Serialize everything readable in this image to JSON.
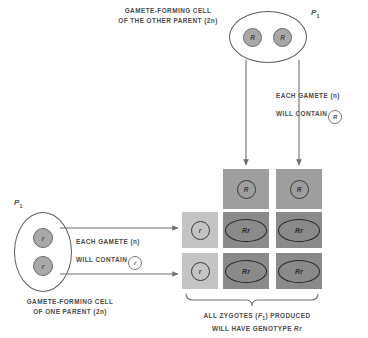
{
  "diagram": {
    "title_top": "GAMETE-FORMING CELL OF THE OTHER PARENT (2n)",
    "top_cell": {
      "label_line1": "GAMETE-FORMING CELL",
      "label_line2": "OF THE OTHER PARENT (2n)",
      "generation_label": "P",
      "generation_sub": "1",
      "alleles": [
        "R",
        "R"
      ]
    },
    "left_cell": {
      "label_line1": "GAMETE-FORMING CELL",
      "label_line2": "OF ONE PARENT (2n)",
      "generation_label": "P",
      "generation_sub": "1",
      "alleles": [
        "r",
        "r"
      ]
    },
    "right_note": {
      "line1": "EACH GAMETE (n)",
      "line2": "WILL CONTAIN",
      "token": "R"
    },
    "left_note": {
      "line1": "EACH GAMETE (n)",
      "line2": "WILL CONTAIN",
      "token": "r"
    },
    "bottom_note": {
      "line1": "ALL ZYGOTES (F1) PRODUCED",
      "line2": "WILL HAVE GENOTYPE Rr",
      "f_letter": "F",
      "f_sub": "1",
      "genotype": "Rr"
    },
    "punnett": {
      "column_gametes": [
        "R",
        "R"
      ],
      "row_gametes": [
        "r",
        "r"
      ],
      "offspring": [
        [
          "Rr",
          "Rr"
        ],
        [
          "Rr",
          "Rr"
        ]
      ]
    },
    "colors": {
      "header_cell": "#9e9e9e",
      "row_cell": "#c4c4c4",
      "offspring_cell": "#8a8a8a",
      "allele_fill": "#a8a8a8",
      "outline": "#5d5d5d",
      "text": "#4a4a4a"
    }
  }
}
